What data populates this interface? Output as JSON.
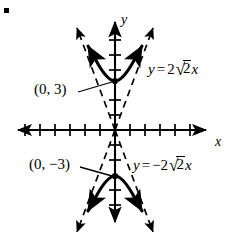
{
  "figure": {
    "type": "hyperbola-graph",
    "bullet_marker": "▪",
    "axes": {
      "x_label": "x",
      "y_label": "y",
      "origin_px": [
        115,
        130
      ],
      "unit_px": 15,
      "x_ticks_left": 6,
      "x_ticks_right": 6,
      "y_ticks_up": 7,
      "y_ticks_down": 6,
      "arrowheads": [
        "left",
        "right",
        "up",
        "down"
      ]
    },
    "curves": [
      {
        "name": "upper-branch",
        "style": "solid",
        "vertex_label": "(0, 3)",
        "vertex_point": [
          0,
          3
        ]
      },
      {
        "name": "lower-branch",
        "style": "solid",
        "vertex_label": "(0, −3)",
        "vertex_point": [
          0,
          -3
        ]
      }
    ],
    "asymptotes": [
      {
        "name": "asymptote-positive-slope",
        "style": "dashed",
        "equation_label": {
          "lhs": "y",
          "eq": "=",
          "coefficient": "2",
          "radical": "√",
          "radicand": "2",
          "variable": "x",
          "full": "y = 2√2x"
        }
      },
      {
        "name": "asymptote-negative-slope",
        "style": "dashed",
        "equation_label": {
          "lhs": "y",
          "eq": "=",
          "coefficient": "−2",
          "radical": "√",
          "radicand": "2",
          "variable": "x",
          "full": "y = −2√2x"
        }
      }
    ],
    "point_labels": [
      {
        "name": "label-vertex-upper",
        "text": "(0, 3)"
      },
      {
        "name": "label-vertex-lower",
        "text": "(0, −3)"
      }
    ],
    "colors": {
      "ink": "#000000",
      "background": "#ffffff"
    }
  }
}
